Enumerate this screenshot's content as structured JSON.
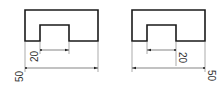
{
  "figures": [
    {
      "id": "left",
      "dimensions": [
        {
          "label": "20",
          "span": "notch-width"
        },
        {
          "label": "50",
          "span": "overall-width"
        }
      ]
    },
    {
      "id": "right",
      "dimensions": [
        {
          "label": "20",
          "span": "notch-width"
        },
        {
          "label": "50",
          "span": "overall-width"
        }
      ]
    }
  ],
  "colors": {
    "outline": "#1a1a1a",
    "dimension": "#333333",
    "background": "#ffffff"
  }
}
